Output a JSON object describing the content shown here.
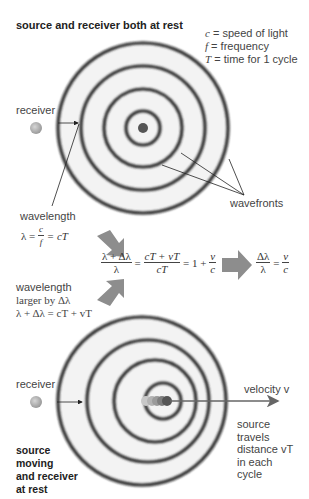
{
  "top_panel": {
    "title": "source and receiver both at rest",
    "legend": [
      {
        "symbol": "c",
        "text": " = speed of light"
      },
      {
        "symbol": "f",
        "text": " = frequency"
      },
      {
        "symbol": "T",
        "text": " = time for 1 cycle"
      }
    ],
    "receiver_label": "receiver",
    "wavefronts_label": "wavefronts",
    "wavelength_label": "wavelength",
    "wavelength_formula": {
      "lhs": "λ =",
      "frac_num": "c",
      "frac_den": "f",
      "rhs": "= cT"
    }
  },
  "middle": {
    "equation": {
      "frac1_num": "λ + Δλ",
      "frac1_den": "λ",
      "eq1": "=",
      "frac2_num": "cT + vT",
      "frac2_den": "cT",
      "eq2": "= 1 +",
      "frac3_num": "v",
      "frac3_den": "c"
    },
    "result": {
      "frac_num": "Δλ",
      "frac_den": "λ",
      "eq": "=",
      "frac2_num": "v",
      "frac2_den": "c"
    }
  },
  "bottom_panel": {
    "wavelength_label_line1": "wavelength",
    "wavelength_label_line2": "larger by Δλ",
    "wavelength_formula": "λ + Δλ = cT + vT",
    "receiver_label": "receiver",
    "velocity_label": "velocity v",
    "source_travel_lines": [
      "source",
      "travels",
      "distance vT",
      "in each",
      "cycle"
    ],
    "title_lines": [
      "source",
      "moving",
      "and receiver",
      "at rest"
    ]
  },
  "colors": {
    "ring": "#2e2e2e",
    "disc": "#f2f2f2",
    "arrow_gray": "#8a8a8a",
    "receiver": "#a8a8a8",
    "source": "#555555"
  }
}
